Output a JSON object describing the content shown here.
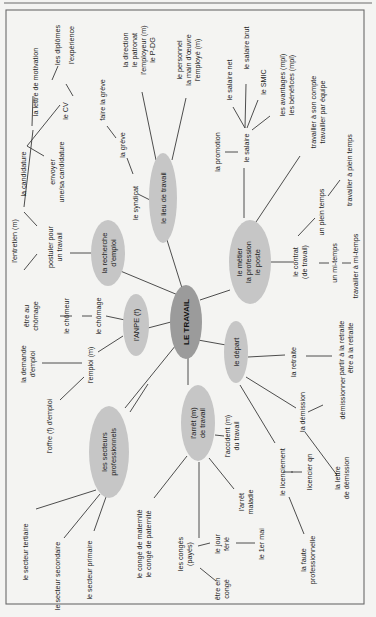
{
  "title": "LE TRAVAIL",
  "colors": {
    "background": "#f4f4f2",
    "frame": "#6b6b6b",
    "center_node": "#9b9b9b",
    "node": "#c6c6c6",
    "text": "#1d1d1d",
    "edge": "#3a3a3a"
  },
  "nodes": {
    "center": {
      "label": "LE TRAVAIL"
    },
    "recherche": {
      "lines": [
        "la recherche",
        "d'emploi"
      ]
    },
    "lieu": {
      "lines": [
        "le lieu de travail"
      ]
    },
    "anpe": {
      "lines": [
        "l'ANPE (f)"
      ]
    },
    "metier": {
      "lines": [
        "le métier",
        "la profession",
        "le poste"
      ]
    },
    "depart": {
      "lines": [
        "le départ"
      ]
    },
    "secteurs": {
      "lines": [
        "les secteurs",
        "professionnels"
      ]
    },
    "arret": {
      "lines": [
        "l'arrêt (m)",
        "de travail"
      ]
    }
  },
  "labels": {
    "candidature": "la candidature",
    "lettre_motivation": "la lettre de motivation",
    "cv": "le CV",
    "diplomes": "les diplômes",
    "experience": "l'expérience",
    "envoyer_1": "envoyer",
    "envoyer_2": "une/sa candidature",
    "entretien": "l'entretien (m)",
    "postuler_1": "postuler pour",
    "postuler_2": "un travail",
    "faire_greve": "faire la grève",
    "greve": "la grève",
    "syndicat": "le syndicat",
    "direction_1": "la direction",
    "direction_2": "le patronat",
    "direction_3": "l'employeur (m)",
    "direction_4": "le P-DG",
    "personnel_1": "le personnel",
    "personnel_2": "la main d'œuvre",
    "personnel_3": "l'employé (m)",
    "promotion": "la promotion",
    "salaire": "le salaire",
    "salaire_net": "le salaire net",
    "salaire_brut": "le salaire brut",
    "smic": "le SMIC",
    "avantages_1": "les avantages (mpl)",
    "avantages_2": "les bénéfices (mpl)",
    "compte_1": "travailler à son compte",
    "compte_2": "travailler par équipe",
    "plein_temps": "un plein temps",
    "travailler_plein": "travailler à plein temps",
    "contrat_1": "le contrat",
    "contrat_2": "(de travail)",
    "mi_temps": "un mi-temps",
    "travailler_mi": "travailler à mi-temps",
    "etre_chomage_1": "être au",
    "etre_chomage_2": "chômage",
    "chomeur": "le chômeur",
    "chomage": "le chômage",
    "demande_1": "la demande",
    "demande_2": "d'emploi",
    "emploi": "l'emploi (m)",
    "offre": "l'offre (f) d'emploi",
    "retraite": "la retraite",
    "partir_1": "partir à la retraite",
    "partir_2": "être à la retraite",
    "demission": "la démission",
    "demissionner": "démissionner",
    "lettre_dem_1": "la lettre",
    "lettre_dem_2": "de démission",
    "licenciement": "le licenciement",
    "licencier": "licencier qn",
    "faute_1": "la faute",
    "faute_2": "professionnelle",
    "accident_1": "l'accident (m)",
    "accident_2": "du travail",
    "arret_maladie_1": "l'arrêt",
    "arret_maladie_2": "maladie",
    "tertiaire": "le secteur tertiaire",
    "secondaire": "le secteur secondaire",
    "primaire": "le secteur primaire",
    "conge_mat_1": "le congé de maternité",
    "conge_mat_2": "le congé de paternité",
    "conges_1": "les congés",
    "conges_2": "(payés)",
    "jour_1": "le jour",
    "jour_2": "férié",
    "premier_mai": "le 1er mai",
    "etre_conge_1": "être en",
    "etre_conge_2": "congé"
  }
}
